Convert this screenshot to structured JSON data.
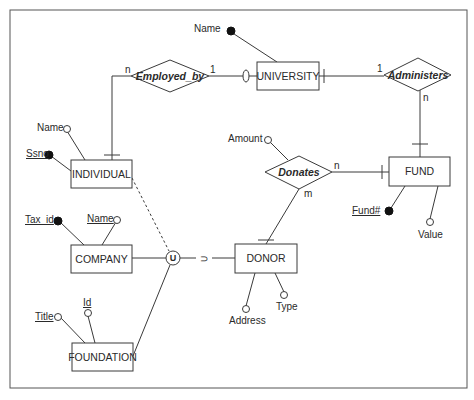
{
  "diagram": {
    "type": "ER diagram",
    "entities": {
      "university": "UNIVERSITY",
      "individual": "INDIVIDUAL",
      "fund": "FUND",
      "donor": "DONOR",
      "company": "COMPANY",
      "foundation": "FOUNDATION"
    },
    "relationships": {
      "employed_by": "Employed_by",
      "administers": "Administers",
      "donates": "Donates"
    },
    "attributes": {
      "university_name": "Name",
      "individual_name": "Name",
      "individual_ssno": "Ssno",
      "donates_amount": "Amount",
      "fund_number": "Fund#",
      "fund_value": "Value",
      "donor_address": "Address",
      "donor_type": "Type",
      "company_tax_id": "Tax_id",
      "company_name": "Name",
      "foundation_title": "Title",
      "foundation_id": "Id"
    },
    "cardinalities": {
      "employed_by_individual": "n",
      "employed_by_university": "1",
      "administers_university": "1",
      "administers_fund": "n",
      "donates_fund": "n",
      "donates_donor": "m"
    },
    "union_symbol": "U",
    "subset_symbol": "⊃"
  }
}
